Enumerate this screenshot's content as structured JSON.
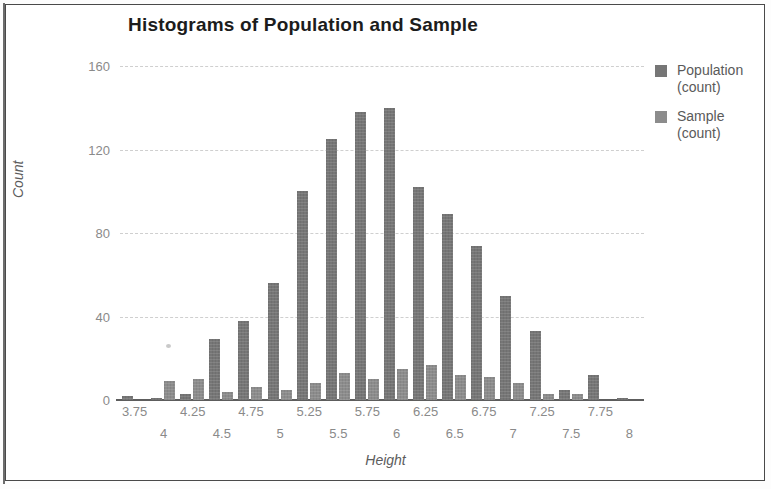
{
  "chart_data": {
    "type": "bar",
    "title": "Histograms of Population and Sample",
    "xlabel": "Height",
    "ylabel": "Count",
    "ylim": [
      0,
      160
    ],
    "yticks": [
      0,
      40,
      80,
      120,
      160
    ],
    "grid": true,
    "legend_position": "right",
    "categories": [
      "3.75",
      "4",
      "4.25",
      "4.5",
      "4.75",
      "5",
      "5.25",
      "5.5",
      "5.75",
      "6",
      "6.25",
      "6.5",
      "6.75",
      "7",
      "7.25",
      "7.5",
      "7.75",
      "8"
    ],
    "xtick_labels_top": [
      "3.75",
      "4.25",
      "4.75",
      "5.25",
      "5.75",
      "6.25",
      "6.75",
      "7.25",
      "7.75"
    ],
    "xtick_labels_bottom": [
      "4",
      "4.5",
      "5",
      "5.5",
      "6",
      "6.5",
      "7",
      "7.5",
      "8"
    ],
    "series": [
      {
        "name": "Population (count)",
        "color": "#767676",
        "values": [
          2,
          1,
          3,
          29,
          38,
          56,
          100,
          125,
          138,
          140,
          102,
          89,
          74,
          50,
          33,
          5,
          12,
          1
        ]
      },
      {
        "name": "Sample (count)",
        "color": "#8c8c8c",
        "values": [
          0,
          9,
          10,
          4,
          6,
          5,
          8,
          13,
          10,
          15,
          17,
          12,
          11,
          8,
          3,
          3,
          0,
          0
        ]
      }
    ],
    "bar_pairs": [
      {
        "bin": "3.75",
        "population": 2,
        "sample": 0
      },
      {
        "bin": "4",
        "population": 1,
        "sample": 9
      },
      {
        "bin": "4.25",
        "population": 3,
        "sample": 10
      },
      {
        "bin": "4.5",
        "population": 29,
        "sample": 4
      },
      {
        "bin": "4.75",
        "population": 38,
        "sample": 6
      },
      {
        "bin": "5",
        "population": 56,
        "sample": 5
      },
      {
        "bin": "5.25",
        "population": 100,
        "sample": 8
      },
      {
        "bin": "5.5",
        "population": 125,
        "sample": 13
      },
      {
        "bin": "5.75",
        "population": 138,
        "sample": 10
      },
      {
        "bin": "6",
        "population": 140,
        "sample": 15
      },
      {
        "bin": "6.25",
        "population": 102,
        "sample": 17
      },
      {
        "bin": "6.5",
        "population": 89,
        "sample": 12
      },
      {
        "bin": "6.75",
        "population": 74,
        "sample": 11
      },
      {
        "bin": "7",
        "population": 50,
        "sample": 8
      },
      {
        "bin": "7.25",
        "population": 33,
        "sample": 3
      },
      {
        "bin": "7.5",
        "population": 5,
        "sample": 3
      },
      {
        "bin": "7.75",
        "population": 12,
        "sample": 0
      },
      {
        "bin": "8",
        "population": 1,
        "sample": 0
      }
    ]
  },
  "legend": {
    "items": [
      {
        "label": "Population",
        "sublabel": "(count)"
      },
      {
        "label": "Sample",
        "sublabel": "(count)"
      }
    ]
  }
}
